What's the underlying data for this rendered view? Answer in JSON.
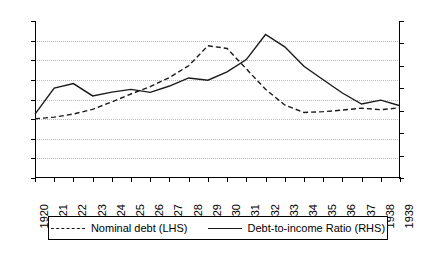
{
  "chart_data": {
    "type": "line",
    "title": "",
    "xlabel": "",
    "ylabel": "",
    "grid": true,
    "legend_position": "bottom",
    "categories": [
      "1920",
      "1921",
      "1922",
      "1923",
      "1924",
      "1925",
      "1926",
      "1927",
      "1928",
      "1929",
      "1930",
      "1931",
      "1932",
      "1933",
      "1934",
      "1935",
      "1936",
      "1937",
      "1938",
      "1939"
    ],
    "axes": {
      "left": {
        "label": "Nominal debt (LHS)",
        "ylim": [
          20,
          60
        ],
        "tick_step": 5,
        "ticks": [
          "20",
          "25",
          "30",
          "35",
          "40",
          "45",
          "50",
          "55",
          "60"
        ]
      },
      "right": {
        "label": "Debt-to-income Ratio (RHS)",
        "ylim": [
          20,
          90
        ],
        "tick_step": 10,
        "ticks": [
          "20",
          "30",
          "40",
          "50",
          "60",
          "70",
          "80",
          "90"
        ]
      }
    },
    "series": [
      {
        "name": "Nominal debt (LHS)",
        "axis": "left",
        "style": "dashed",
        "color": "#1a1a1a",
        "values": [
          35.1,
          35.5,
          36.3,
          37.5,
          39.4,
          41.4,
          43.3,
          45.6,
          48.6,
          53.7,
          53.0,
          47.8,
          42.6,
          38.6,
          36.7,
          36.9,
          37.3,
          37.8,
          37.4,
          37.9
        ]
      },
      {
        "name": "Debt-to-income Ratio (RHS)",
        "axis": "right",
        "style": "solid",
        "color": "#1a1a1a",
        "values": [
          48.5,
          60.1,
          62.1,
          56.6,
          58.3,
          59.5,
          58.2,
          61.0,
          64.6,
          63.6,
          67.3,
          72.8,
          84.0,
          78.5,
          69.8,
          63.8,
          57.9,
          53.0,
          54.7,
          52.2
        ]
      }
    ],
    "legend": [
      {
        "label": "Nominal debt (LHS)",
        "style": "dashed"
      },
      {
        "label": "Debt-to-income Ratio (RHS)",
        "style": "solid"
      }
    ]
  }
}
